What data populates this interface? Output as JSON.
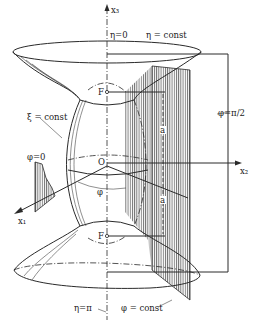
{
  "figure": {
    "type": "prolate spheroidal coordinate system",
    "axes": {
      "x1": "x₁",
      "x2": "x₂",
      "x3": "x₃"
    },
    "labels": {
      "eta_zero": "η=0",
      "eta_const": "η = const",
      "eta_pi": "η=π",
      "xi_const": "ξ = const",
      "phi_zero": "φ=0",
      "phi_half_pi": "φ=π/2",
      "phi_const": "φ = const",
      "phi": "φ",
      "origin": "O",
      "focus_top": "F",
      "focus_bottom": "F",
      "a_top": "a",
      "a_bottom": "a"
    },
    "colors": {
      "line": "#2a2a2a",
      "hatch": "#555555",
      "background": "#ffffff"
    }
  }
}
